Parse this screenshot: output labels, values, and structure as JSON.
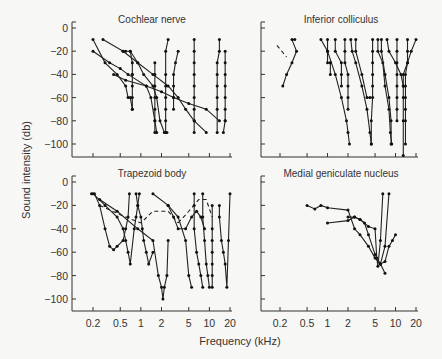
{
  "figure": {
    "xlabel": "Frequency (kHz)",
    "ylabel": "Sound intensity (db)"
  },
  "chart_data": [
    {
      "type": "line",
      "title": "Cochlear nerve",
      "panel": "top-left",
      "xlabel": "Frequency (kHz)",
      "ylabel": "Sound intensity (db)",
      "xscale": "log",
      "xticks": [
        0.2,
        0.5,
        1,
        2,
        5,
        10,
        20
      ],
      "yticks": [
        0,
        -20,
        -40,
        -60,
        -80,
        -100
      ],
      "ylim": [
        -110,
        0
      ],
      "grid": false,
      "series": [
        {
          "name": "curve 1",
          "x": [
            0.2,
            0.3,
            0.45,
            0.6,
            0.65,
            0.7,
            0.75
          ],
          "y": [
            -10,
            -30,
            -40,
            -50,
            -60,
            -60,
            -70
          ]
        },
        {
          "name": "curve 2",
          "x": [
            0.2,
            0.35,
            0.5,
            0.65,
            1.2,
            1.4,
            1.6,
            1.7
          ],
          "y": [
            -20,
            -30,
            -35,
            -40,
            -50,
            -60,
            -80,
            -90
          ]
        },
        {
          "name": "curve 3",
          "x": [
            0.28,
            0.55,
            0.6,
            0.7,
            0.9,
            1.1,
            1.5,
            1.7,
            1.9,
            2.2,
            2.4
          ],
          "y": [
            -10,
            -20,
            -20,
            -20,
            -30,
            -40,
            -50,
            -60,
            -80,
            -90,
            -90
          ]
        },
        {
          "name": "curve 4",
          "x": [
            0.7,
            0.75,
            0.75,
            0.75,
            0.75,
            0.75,
            0.75
          ],
          "y": [
            -20,
            -30,
            -40,
            -50,
            -60,
            -70,
            -40
          ]
        },
        {
          "name": "curve 5",
          "x": [
            0.55,
            0.9,
            1.5,
            2.5,
            3.5,
            4.5,
            6,
            9
          ],
          "y": [
            -20,
            -30,
            -40,
            -50,
            -60,
            -70,
            -80,
            -90
          ]
        },
        {
          "name": "curve 6",
          "x": [
            0.4,
            0.6,
            1.2,
            2,
            3,
            5,
            9,
            14
          ],
          "y": [
            -40,
            -45,
            -50,
            -55,
            -60,
            -65,
            -70,
            -80
          ]
        },
        {
          "name": "curve 7",
          "x": [
            1.6,
            1.6,
            1.6,
            1.6,
            1.6,
            1.6,
            1.6
          ],
          "y": [
            -30,
            -40,
            -50,
            -60,
            -70,
            -80,
            -90
          ]
        },
        {
          "name": "curve 8",
          "x": [
            2.5,
            2.3,
            2.3,
            2.3,
            2.3,
            2.3,
            2.3,
            2.3
          ],
          "y": [
            -10,
            -20,
            -40,
            -50,
            -60,
            -70,
            -80,
            -90
          ]
        },
        {
          "name": "curve 9",
          "x": [
            3.5,
            3.2,
            3.0,
            3.0,
            3.0,
            3.0
          ],
          "y": [
            -20,
            -30,
            -40,
            -50,
            -60,
            -70
          ]
        },
        {
          "name": "curve 10",
          "x": [
            6,
            6,
            6,
            6,
            6,
            6,
            6,
            6,
            6
          ],
          "y": [
            -10,
            -20,
            -30,
            -40,
            -50,
            -60,
            -70,
            -80,
            -90
          ]
        },
        {
          "name": "curve 11",
          "x": [
            17,
            17,
            17,
            17,
            17,
            17,
            17,
            16,
            17
          ],
          "y": [
            -20,
            -30,
            -40,
            -50,
            -60,
            -70,
            -80,
            -90,
            -80
          ]
        },
        {
          "name": "curve 12",
          "x": [
            14,
            14,
            13,
            13,
            13,
            13,
            13,
            13
          ],
          "y": [
            -10,
            -20,
            -30,
            -40,
            -50,
            -60,
            -70,
            -90
          ]
        }
      ]
    },
    {
      "type": "line",
      "title": "Inferior colliculus",
      "panel": "top-right",
      "xscale": "log",
      "xticks": [
        0.2,
        0.5,
        1,
        2,
        5,
        10,
        20
      ],
      "yticks": [
        0,
        -20,
        -40,
        -60,
        -80,
        -100
      ],
      "ylim": [
        -110,
        0
      ],
      "grid": false,
      "series": [
        {
          "name": "dashed",
          "style": "dashed",
          "x": [
            0.18,
            0.25
          ],
          "y": [
            -15,
            -25
          ]
        },
        {
          "name": "curve 1",
          "x": [
            0.22,
            0.25,
            0.3,
            0.35,
            0.3,
            0.33
          ],
          "y": [
            -50,
            -40,
            -30,
            -20,
            -10,
            -10
          ]
        },
        {
          "name": "curve 2",
          "x": [
            0.8,
            1.0,
            1.3,
            1.6,
            1.9,
            2.0,
            2.1
          ],
          "y": [
            -10,
            -20,
            -40,
            -60,
            -80,
            -90,
            -100
          ]
        },
        {
          "name": "curve 3",
          "x": [
            1.0,
            1.0,
            1.0,
            1.1,
            1.1,
            1.1
          ],
          "y": [
            -10,
            -20,
            -30,
            -30,
            -40,
            -30
          ]
        },
        {
          "name": "curve 4",
          "x": [
            1.3,
            1.3,
            1.6,
            1.6,
            1.6
          ],
          "y": [
            -10,
            -20,
            -30,
            -40,
            -50
          ]
        },
        {
          "name": "curve 5",
          "x": [
            1.8,
            1.8,
            1.8,
            2.0,
            2.0,
            2.0,
            2.0
          ],
          "y": [
            -10,
            -20,
            -30,
            -40,
            -50,
            -60,
            -70
          ]
        },
        {
          "name": "curve 6",
          "x": [
            2.2,
            2.3,
            2.6,
            3.2,
            3.8,
            4.2,
            4.4
          ],
          "y": [
            -10,
            -20,
            -30,
            -50,
            -70,
            -90,
            -100
          ]
        },
        {
          "name": "curve 7",
          "x": [
            2.6,
            2.6,
            3.2,
            3.8,
            4.2
          ],
          "y": [
            -10,
            -20,
            -40,
            -60,
            -60
          ]
        },
        {
          "name": "curve 8",
          "x": [
            4.6,
            4.6,
            4.6,
            4.6,
            4.6,
            4.6,
            4.4,
            4.4
          ],
          "y": [
            -10,
            -20,
            -30,
            -40,
            -50,
            -60,
            -80,
            -100
          ]
        },
        {
          "name": "curve 9",
          "x": [
            5.5,
            5.5,
            6.5,
            7,
            8,
            8.4,
            8.8
          ],
          "y": [
            -10,
            -20,
            -30,
            -50,
            -70,
            -90,
            -100
          ]
        },
        {
          "name": "curve 10",
          "x": [
            6.2,
            6.2,
            7,
            8,
            8.6,
            8.6
          ],
          "y": [
            -10,
            -20,
            -40,
            -60,
            -80,
            -100
          ]
        },
        {
          "name": "curve 11",
          "x": [
            7.5,
            8,
            10,
            12,
            13,
            13,
            13,
            13
          ],
          "y": [
            -10,
            -20,
            -30,
            -40,
            -50,
            -60,
            -80,
            -110
          ]
        },
        {
          "name": "curve 12",
          "x": [
            20,
            17,
            15,
            13,
            13
          ],
          "y": [
            -10,
            -20,
            -30,
            -40,
            -50
          ]
        },
        {
          "name": "curve 13",
          "x": [
            10.5,
            10.5,
            10.5,
            10.5,
            10.5,
            10.5,
            10.5,
            10.5
          ],
          "y": [
            -10,
            -20,
            -30,
            -40,
            -50,
            -60,
            -70,
            -80
          ]
        },
        {
          "name": "curve 14",
          "x": [
            15,
            15,
            15,
            14,
            14,
            14,
            14,
            14,
            14
          ],
          "y": [
            -10,
            -20,
            -30,
            -40,
            -50,
            -60,
            -70,
            -80,
            -100
          ]
        }
      ]
    },
    {
      "type": "line",
      "title": "Trapezoid body",
      "panel": "bottom-left",
      "xscale": "log",
      "xticks": [
        0.2,
        0.5,
        1,
        2,
        5,
        10,
        20
      ],
      "xticklabels": [
        "0.2",
        "0.5",
        "1",
        "2",
        "5",
        "10",
        "20"
      ],
      "yticks": [
        0,
        -20,
        -40,
        -60,
        -80,
        -100
      ],
      "ylim": [
        -110,
        0
      ],
      "grid": false,
      "series": [
        {
          "name": "curve 1",
          "x": [
            0.19,
            0.21,
            0.25,
            0.3,
            0.35,
            0.4,
            0.45,
            0.55,
            0.6,
            0.65,
            0.68
          ],
          "y": [
            -10,
            -10,
            -20,
            -40,
            -55,
            -58,
            -55,
            -50,
            -40,
            -30,
            -10
          ]
        },
        {
          "name": "curve 2",
          "x": [
            0.2,
            0.3,
            0.45,
            0.55,
            0.6,
            0.65,
            0.7,
            0.8,
            0.85,
            0.9,
            0.95
          ],
          "y": [
            -10,
            -20,
            -30,
            -40,
            -50,
            -60,
            -70,
            -40,
            -30,
            -20,
            -10
          ]
        },
        {
          "name": "curve 3",
          "x": [
            0.85,
            0.9,
            1.0,
            1.05,
            1.1,
            1.2,
            1.3,
            1.5
          ],
          "y": [
            -10,
            -20,
            -30,
            -40,
            -50,
            -60,
            -70,
            -60
          ]
        },
        {
          "name": "curve 4",
          "x": [
            0.25,
            0.45,
            0.9,
            1.5,
            1.8,
            2.0,
            2.1,
            2.2,
            2.4,
            2.5
          ],
          "y": [
            -15,
            -25,
            -40,
            -50,
            -80,
            -90,
            -100,
            -90,
            -80,
            -50
          ]
        },
        {
          "name": "curve 5",
          "x": [
            1.5,
            2.5,
            3.5,
            4.5,
            5.0,
            5.5
          ],
          "y": [
            -10,
            -20,
            -30,
            -50,
            -80,
            -90
          ]
        },
        {
          "name": "dashed 1",
          "style": "dashed",
          "x": [
            0.25,
            0.6,
            1.0,
            1.5,
            2.5,
            3.5
          ],
          "y": [
            -20,
            -30,
            -35,
            -25,
            -25,
            -35
          ]
        },
        {
          "name": "dashed 2",
          "style": "dashed",
          "x": [
            3.5,
            5,
            7,
            9,
            11
          ],
          "y": [
            -35,
            -25,
            -15,
            -15,
            -30
          ]
        },
        {
          "name": "curve 6",
          "x": [
            2.5,
            3.0,
            3.5,
            4.5,
            5.5,
            6.5,
            7.5,
            8.5
          ],
          "y": [
            -20,
            -30,
            -40,
            -40,
            -30,
            -25,
            -30,
            -40
          ]
        },
        {
          "name": "curve 7",
          "x": [
            6,
            6,
            6,
            6.5,
            7,
            7.5,
            8
          ],
          "y": [
            -10,
            -20,
            -40,
            -60,
            -70,
            -80,
            -90
          ]
        },
        {
          "name": "curve 8",
          "x": [
            8,
            8,
            8.5,
            9,
            9.5,
            10
          ],
          "y": [
            -10,
            -30,
            -50,
            -70,
            -80,
            -90
          ]
        },
        {
          "name": "curve 9",
          "x": [
            11,
            11,
            11,
            11,
            11,
            11,
            11
          ],
          "y": [
            -20,
            -40,
            -50,
            -60,
            -70,
            -80,
            -90
          ]
        },
        {
          "name": "curve 10",
          "x": [
            14,
            14,
            15,
            16,
            17,
            18,
            19,
            20
          ],
          "y": [
            -20,
            -30,
            -50,
            -60,
            -70,
            -90,
            -50,
            -10
          ]
        }
      ]
    },
    {
      "type": "line",
      "title": "Medial geniculate nucleus",
      "panel": "bottom-right",
      "xscale": "log",
      "xticks": [
        0.2,
        0.5,
        1,
        2,
        5,
        10,
        20
      ],
      "xticklabels": [
        "0.2",
        "0.5",
        "1",
        "2",
        "5",
        "10",
        "20"
      ],
      "yticks": [
        0,
        -20,
        -40,
        -60,
        -80,
        -100
      ],
      "ylim": [
        -110,
        0
      ],
      "grid": false,
      "series": [
        {
          "name": "curve 1",
          "x": [
            0.5,
            0.65,
            0.8,
            1.0,
            2.0,
            2.5,
            3.0,
            4.0,
            5.0,
            6.0,
            7.0
          ],
          "y": [
            -20,
            -23,
            -20,
            -22,
            -24,
            -40,
            -45,
            -55,
            -65,
            -70,
            -78
          ]
        },
        {
          "name": "curve 2",
          "x": [
            1.0,
            2.0,
            2.5,
            3.0,
            4.0,
            5.0,
            5.3,
            5.5,
            6.0,
            6.5
          ],
          "y": [
            -35,
            -33,
            -30,
            -32,
            -38,
            -40,
            -65,
            -72,
            -50,
            -10
          ]
        },
        {
          "name": "curve 3",
          "x": [
            2.0,
            2.5,
            3.0,
            3.5,
            4.0,
            5.0,
            6.0,
            7.0,
            8.0
          ],
          "y": [
            -30,
            -30,
            -32,
            -35,
            -45,
            -62,
            -70,
            -55,
            -10
          ]
        },
        {
          "name": "curve 4",
          "x": [
            6.0,
            7.0,
            8.0,
            9.0,
            10.0
          ],
          "y": [
            -70,
            -68,
            -55,
            -50,
            -45
          ]
        }
      ]
    }
  ]
}
